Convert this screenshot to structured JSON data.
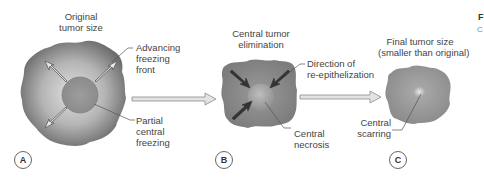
{
  "panels": [
    {
      "id": "A",
      "title": "Original\ntumor size",
      "title_lines": [
        "Original",
        "tumor size"
      ],
      "callouts": [
        {
          "lines": [
            "Advancing",
            "freezing",
            "front"
          ]
        },
        {
          "lines": [
            "Partial",
            "central",
            "freezing"
          ]
        }
      ]
    },
    {
      "id": "B",
      "title_lines": [
        "Central tumor",
        "elimination"
      ],
      "callouts": [
        {
          "lines": [
            "Direction of",
            "re-epithelization"
          ]
        },
        {
          "lines": [
            "Central",
            "necrosis"
          ]
        }
      ]
    },
    {
      "id": "C",
      "title_lines": [
        "Final tumor size",
        "(smaller than original)"
      ],
      "callouts": [
        {
          "lines": [
            "Central",
            "scarring"
          ]
        }
      ]
    }
  ],
  "figure_tag": {
    "main": "F",
    "sub": "C"
  },
  "colors": {
    "tumor_dark": "#6e6e6e",
    "tumor_light": "#d9d9d9",
    "arrow_fill": "#e3e3e3",
    "arrow_stroke": "#8a8a8a",
    "leader_line": "#555555"
  },
  "icons": {
    "outward_arrows": "arrow-outward",
    "inward_arrows": "arrow-inward",
    "process_arrow": "arrow-right"
  }
}
